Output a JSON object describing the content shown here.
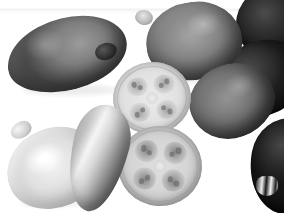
{
  "image": {
    "title": "Feijoa fruits — whole and halved",
    "subject": "feijoa-fruit",
    "medium": "grayscale-photograph",
    "background_color": "#ffffff",
    "width": 284,
    "height": 213,
    "artifact": "faint horizontal scan band across the upper edge"
  },
  "palette": {
    "background": "#ffffff",
    "dark_skin": "#2b2b29",
    "mid_skin": "#75756f",
    "light_skin": "#dcdbd6",
    "flesh": "#dedcd6",
    "seed_cavity": "#62605b"
  },
  "objects": [
    {
      "id": "fruit-a",
      "name": "whole-fruit-upper-left",
      "tone": "dark olive, heavily mottled skin",
      "shape": "large elongated ovoid",
      "position": "upper left",
      "calyx": "dark stem nub at right tip"
    },
    {
      "id": "fruit-b",
      "name": "whole-fruit-top-middle",
      "tone": "medium grey with pale bloom highlight",
      "shape": "broad ovoid",
      "position": "top middle",
      "calyx": "pale calyx stub at left tip"
    },
    {
      "id": "fruit-c",
      "name": "whole-fruit-top-right",
      "tone": "very dark, near black",
      "shape": "round, cropped by frame edge",
      "position": "top right corner",
      "calyx": "none visible"
    },
    {
      "id": "fruit-d",
      "name": "whole-fruit-middle-right",
      "tone": "dark, low contrast",
      "shape": "tilted ovoid",
      "position": "middle right",
      "calyx": "small striped calyx at lower left tip"
    },
    {
      "id": "fruit-e",
      "name": "whole-fruit-right-centre",
      "tone": "mottled mid grey",
      "shape": "ovoid tilted left",
      "position": "right of centre",
      "calyx": "none visible"
    },
    {
      "id": "fruit-f",
      "name": "whole-fruit-bottom-left",
      "tone": "pale, smooth and bright",
      "shape": "rounded ovoid",
      "position": "bottom left",
      "calyx": "pale calyx at upper left tip"
    },
    {
      "id": "fruit-g",
      "name": "whole-fruit-slender-centre",
      "tone": "glossy, strong specular highlight down the length",
      "shape": "slender elongated teardrop",
      "position": "bottom centre-left",
      "calyx": "dark tip at lower end"
    },
    {
      "id": "fruit-h",
      "name": "whole-fruit-bottom-right",
      "tone": "very dark",
      "shape": "ovoid, cropped by right frame edge",
      "position": "bottom right corner",
      "calyx": "light striped calyx at the bottom"
    },
    {
      "id": "slice-top",
      "name": "cross-section-upper",
      "tone": "pale flesh with translucent centre",
      "shape": "circular cut face",
      "position": "centre",
      "lobes": 4,
      "detail": "four symmetric seed-cavity lobes around a pale central pith"
    },
    {
      "id": "slice-bottom",
      "name": "cross-section-lower",
      "tone": "pale flesh, darker granular seed clusters",
      "shape": "circular cut face",
      "position": "centre below",
      "lobes": 4,
      "detail": "four seed cavities filled with granular pulp, clearly defined"
    }
  ],
  "counts": {
    "whole_fruits": 8,
    "cross_sections": 2
  }
}
